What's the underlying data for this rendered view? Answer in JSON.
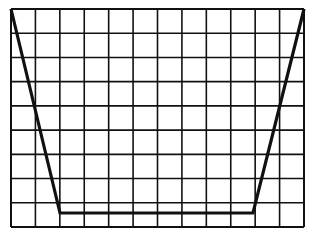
{
  "diagram": {
    "type": "oscilloscope-grid-waveform",
    "grid": {
      "columns": 12,
      "rows": 9,
      "left": 11,
      "top": 9,
      "right": 304,
      "bottom": 227,
      "line_color": "#111111",
      "background": "#ffffff"
    },
    "waveform": {
      "shape": "trapezoid",
      "color": "#111111",
      "points": [
        [
          11,
          9
        ],
        [
          60,
          213
        ],
        [
          253,
          213
        ],
        [
          304,
          9
        ]
      ]
    }
  }
}
